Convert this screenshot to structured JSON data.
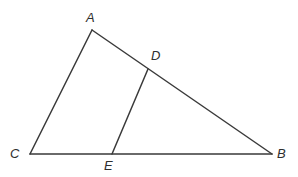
{
  "figure": {
    "background_color": "#ffffff",
    "stroke_color": "#3a3a3a",
    "label_color": "#2e2e2e",
    "stroke_width": 1.5,
    "width": 298,
    "height": 177
  },
  "points": {
    "A": {
      "label": "A",
      "x": 92,
      "y": 30,
      "label_x": 86,
      "label_y": 11
    },
    "B": {
      "label": "B",
      "x": 272,
      "y": 154,
      "label_x": 277,
      "label_y": 147
    },
    "C": {
      "label": "C",
      "x": 30,
      "y": 154,
      "label_x": 10,
      "label_y": 147
    },
    "D": {
      "label": "D",
      "x": 148,
      "y": 69,
      "label_x": 151,
      "label_y": 49
    },
    "E": {
      "label": "E",
      "x": 112,
      "y": 154,
      "label_x": 104,
      "label_y": 159
    }
  },
  "segments": [
    {
      "name": "segment-CA",
      "from": "C",
      "to": "A",
      "x1": 30,
      "y1": 154,
      "x2": 92,
      "y2": 30
    },
    {
      "name": "segment-AB",
      "from": "A",
      "to": "B",
      "x1": 92,
      "y1": 30,
      "x2": 272,
      "y2": 154
    },
    {
      "name": "segment-CB",
      "from": "C",
      "to": "B",
      "x1": 30,
      "y1": 154,
      "x2": 272,
      "y2": 154
    },
    {
      "name": "segment-DE",
      "from": "D",
      "to": "E",
      "x1": 148,
      "y1": 69,
      "x2": 112,
      "y2": 154
    }
  ]
}
